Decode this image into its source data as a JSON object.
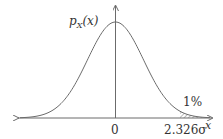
{
  "diagram": {
    "y_label": {
      "prefix": "p",
      "subscript": "X",
      "suffix": "(x)"
    },
    "x_label": "x",
    "origin_label": "0",
    "threshold_label": "2.326σ",
    "tail_label": "1%",
    "colors": {
      "line": "#6b6b6b",
      "text": "#333333",
      "background": "#ffffff"
    }
  },
  "chart_data": {
    "type": "line",
    "title": "",
    "xlabel": "x",
    "ylabel": "p_X(x)",
    "series": [
      {
        "name": "Normal density",
        "mean": 0,
        "std": "σ"
      }
    ],
    "annotations": [
      {
        "text": "0",
        "x": 0
      },
      {
        "text": "2.326σ",
        "x": 2.326
      },
      {
        "text": "1%",
        "shaded_region": "x > 2.326σ"
      }
    ],
    "grid": false
  }
}
